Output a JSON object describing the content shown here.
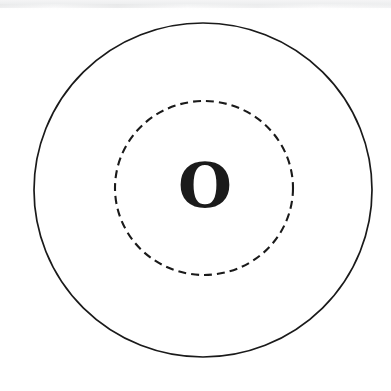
{
  "figure": {
    "title": "",
    "background_color": "#ffffff",
    "width": 391,
    "height": 391,
    "center_label": {
      "text": "O",
      "color": "#1b1b1b",
      "font_size_px": 62,
      "weight": "bold",
      "x": 205,
      "y": 186
    },
    "outer_circle": {
      "name": "outer boundary circle",
      "style": "solid",
      "stroke_color": "#1a1a1a",
      "stroke_width_px": 1.7,
      "fill": "none",
      "center_x": 203,
      "center_y": 190,
      "radius_x": 169,
      "radius_y": 167
    },
    "inner_circle": {
      "name": "inner dashed circle",
      "style": "dashed",
      "stroke_color": "#1a1a1a",
      "stroke_width_px": 2.1,
      "fill": "none",
      "dash_length_px": 8,
      "gap_length_px": 5,
      "center_x": 204,
      "center_y": 188,
      "radius_x": 89,
      "radius_y": 87
    },
    "artifact": {
      "name": "scanner streak",
      "location": "top edge",
      "color": "#ececed"
    }
  }
}
